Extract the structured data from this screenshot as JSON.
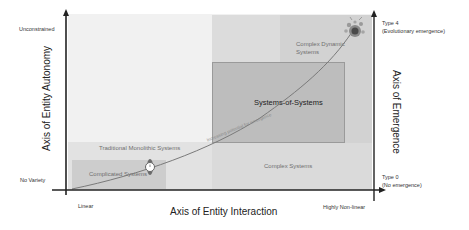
{
  "diagram": {
    "x_axis": {
      "title": "Axis of Entity Interaction",
      "min_label": "Linear",
      "max_label": "Highly Non-linear"
    },
    "y_axis_left": {
      "title": "Axis of Entity Autonomy",
      "min_label": "No Variety",
      "max_label": "Unconstrained"
    },
    "y_axis_right": {
      "title": "Axis of Emergence",
      "min_label_line1": "Type 0",
      "min_label_line2": "(No emergence)",
      "max_label_line1": "Type 4",
      "max_label_line2": "(Evolutionary emergence)"
    },
    "regions": [
      {
        "name": "traditional-monolithic-systems",
        "label": "Traditional Monolithic Systems"
      },
      {
        "name": "complicated-systems",
        "label": "Complicated Systems"
      },
      {
        "name": "systems-of-systems",
        "label": "Systems-of-Systems"
      },
      {
        "name": "complex-systems",
        "label": "Complex Systems"
      },
      {
        "name": "complex-dynamic-systems",
        "label_line1": "Complex Dynamic",
        "label_line2": "Systems"
      }
    ],
    "curve_label": "Increasing potential for emergence",
    "colors": {
      "background_region": "#efefef",
      "lower_band": "#e0e0e0",
      "complicated": "#cfcfcf",
      "sos": "#bdbdbd",
      "top_right": "#d9d9d9",
      "axis": "#222222",
      "curve": "#7a7a7a"
    }
  }
}
